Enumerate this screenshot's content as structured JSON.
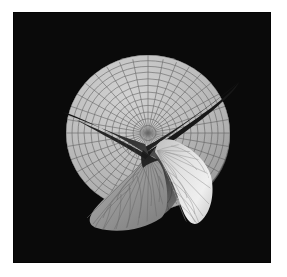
{
  "figure": {
    "width": 287,
    "height": 277,
    "page_background": "#ffffff",
    "title": "",
    "caption": ""
  },
  "panel": {
    "name": "surface-plot-panel",
    "x": 13,
    "y": 12,
    "width": 258,
    "height": 251,
    "background_color": "#0a0a0a",
    "border_color": "#000000"
  },
  "chart_data": {
    "type": "surface",
    "title": "",
    "subtitle": "",
    "xlabel": "",
    "ylabel": "",
    "zlabel": "",
    "grid": true,
    "legend": null,
    "render_style": "shaded-wireframe",
    "projection": "orthographic-3d",
    "colormap": "grayscale",
    "background_color": "#0a0a0a",
    "surface_description": "Riemann-surface style multi-sheeted saddle over a circular polar domain, with a central branch point and three folded lobes",
    "domain": {
      "coordinate_system": "polar",
      "r_min": 0,
      "r_max": 1,
      "theta_min": 0,
      "theta_max": 6.283185307,
      "r_divisions": 12,
      "theta_divisions": 36
    },
    "mesh": {
      "radial_lines": 36,
      "circular_lines": 12,
      "line_color": "#4a4a4a",
      "line_width": 0.6
    },
    "shading": {
      "light_direction": [
        0.4,
        -0.5,
        0.75
      ],
      "ambient": 0.22,
      "diffuse": 0.78,
      "min_gray": "#141414",
      "max_gray": "#f2f2f2",
      "base_gray": "#b4b4b4",
      "highlight_gray": "#ececec",
      "fold_dark_gray": "#232323"
    },
    "view": {
      "elevation_deg": 52,
      "azimuth_deg": -38,
      "disk_center_px": [
        148,
        133
      ],
      "disk_radius_x_px": 82,
      "disk_radius_y_px": 78
    },
    "features": [
      {
        "name": "upper-disk-sheet",
        "tone": "#bcbcbc",
        "note": "large light circular sheet forming the upper background of the surface"
      },
      {
        "name": "left-dark-spike",
        "tone": "#1e1e1e",
        "tip_px": [
          63,
          112
        ],
        "note": "narrow dark wedge extending to the left from the center"
      },
      {
        "name": "upper-right-dark-fold",
        "tone": "#1c1c1c",
        "tip_px": [
          237,
          78
        ],
        "note": "dark curved band sweeping to the upper right"
      },
      {
        "name": "lower-left-lobe",
        "tone": "#989898",
        "note": "mid-gray folded lobe hanging below and to the left"
      },
      {
        "name": "lower-right-highlight-lobe",
        "tone": "#e8e8e8",
        "note": "brightly lit lobe at lower right of the surface"
      },
      {
        "name": "branch-point",
        "px": [
          148,
          145
        ],
        "note": "central singularity where all sheets meet"
      }
    ],
    "series": [
      {
        "name": "sheet-upper",
        "values": [
          1.0,
          0.92,
          0.81,
          0.66,
          0.48,
          0.28,
          0.09,
          -0.08,
          -0.2,
          -0.27,
          -0.3,
          -0.28,
          -0.2
        ]
      },
      {
        "name": "sheet-middle",
        "values": [
          0.0,
          -0.12,
          -0.26,
          -0.41,
          -0.55,
          -0.66,
          -0.73,
          -0.76,
          -0.74,
          -0.68,
          -0.57,
          -0.42,
          -0.24
        ]
      },
      {
        "name": "sheet-lower",
        "values": [
          -1.0,
          -0.95,
          -0.86,
          -0.73,
          -0.57,
          -0.39,
          -0.2,
          -0.02,
          0.14,
          0.27,
          0.36,
          0.41,
          0.42
        ]
      }
    ],
    "x": [
      0,
      0.083,
      0.167,
      0.25,
      0.333,
      0.417,
      0.5,
      0.583,
      0.667,
      0.75,
      0.833,
      0.917,
      1.0
    ],
    "zlim": [
      -1.0,
      1.0
    ]
  }
}
